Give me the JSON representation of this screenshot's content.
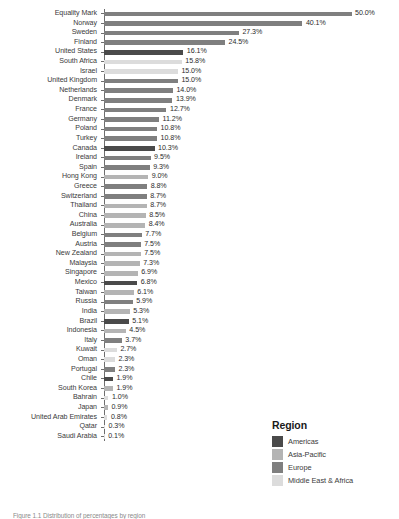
{
  "chart_data": {
    "type": "bar",
    "orientation": "horizontal",
    "title": "",
    "xlabel": "",
    "ylabel": "",
    "xlim": [
      0,
      50.0
    ],
    "grid": false,
    "value_label_suffix": "%",
    "categories": [
      "Equality Mark",
      "Norway",
      "Sweden",
      "Finland",
      "United States",
      "South Africa",
      "Israel",
      "United Kingdom",
      "Netherlands",
      "Denmark",
      "France",
      "Germany",
      "Poland",
      "Turkey",
      "Canada",
      "Ireland",
      "Spain",
      "Hong Kong",
      "Greece",
      "Switzerland",
      "Thailand",
      "China",
      "Australia",
      "Belgium",
      "Austria",
      "New Zealand",
      "Malaysia",
      "Singapore",
      "Mexico",
      "Taiwan",
      "Russia",
      "India",
      "Brazil",
      "Indonesia",
      "Italy",
      "Kuwait",
      "Oman",
      "Portugal",
      "Chile",
      "South Korea",
      "Bahrain",
      "Japan",
      "United Arab Emirates",
      "Qatar",
      "Saudi Arabia"
    ],
    "values": [
      50.0,
      40.1,
      27.3,
      24.5,
      16.1,
      15.8,
      15.0,
      15.0,
      14.0,
      13.9,
      12.7,
      11.2,
      10.8,
      10.8,
      10.3,
      9.5,
      9.3,
      9.0,
      8.8,
      8.7,
      8.7,
      8.5,
      8.4,
      7.7,
      7.5,
      7.5,
      7.3,
      6.9,
      6.8,
      6.1,
      5.9,
      5.3,
      5.1,
      4.5,
      3.7,
      2.7,
      2.3,
      2.3,
      1.9,
      1.9,
      1.0,
      0.9,
      0.8,
      0.3,
      0.1
    ],
    "value_labels": [
      "50.0%",
      "40.1%",
      "27.3%",
      "24.5%",
      "16.1%",
      "15.8%",
      "15.0%",
      "15.0%",
      "14.0%",
      "13.9%",
      "12.7%",
      "11.2%",
      "10.8%",
      "10.8%",
      "10.3%",
      "9.5%",
      "9.3%",
      "9.0%",
      "8.8%",
      "8.7%",
      "8.7%",
      "8.5%",
      "8.4%",
      "7.7%",
      "7.5%",
      "7.5%",
      "7.3%",
      "6.9%",
      "6.8%",
      "6.1%",
      "5.9%",
      "5.3%",
      "5.1%",
      "4.5%",
      "3.7%",
      "2.7%",
      "2.3%",
      "2.3%",
      "1.9%",
      "1.9%",
      "1.0%",
      "0.9%",
      "0.8%",
      "0.3%",
      "0.1%"
    ],
    "region_by_category": [
      "Europe",
      "Europe",
      "Europe",
      "Europe",
      "Americas",
      "Middle East & Africa",
      "Middle East & Africa",
      "Europe",
      "Europe",
      "Europe",
      "Europe",
      "Europe",
      "Europe",
      "Europe",
      "Americas",
      "Europe",
      "Europe",
      "Asia-Pacific",
      "Europe",
      "Europe",
      "Asia-Pacific",
      "Asia-Pacific",
      "Asia-Pacific",
      "Europe",
      "Europe",
      "Asia-Pacific",
      "Asia-Pacific",
      "Asia-Pacific",
      "Americas",
      "Asia-Pacific",
      "Europe",
      "Asia-Pacific",
      "Americas",
      "Asia-Pacific",
      "Europe",
      "Middle East & Africa",
      "Middle East & Africa",
      "Europe",
      "Americas",
      "Asia-Pacific",
      "Middle East & Africa",
      "Asia-Pacific",
      "Middle East & Africa",
      "Middle East & Africa",
      "Middle East & Africa"
    ],
    "legend": {
      "title": "Region",
      "position": "bottom-right",
      "entries": [
        {
          "label": "Americas",
          "color": "#4a4a4a"
        },
        {
          "label": "Asia-Pacific",
          "color": "#b4b4b4"
        },
        {
          "label": "Europe",
          "color": "#7f7f7f"
        },
        {
          "label": "Middle East & Africa",
          "color": "#dcdcdc"
        }
      ]
    }
  },
  "caption": "Figure 1.1  Distribution of percentages by region"
}
